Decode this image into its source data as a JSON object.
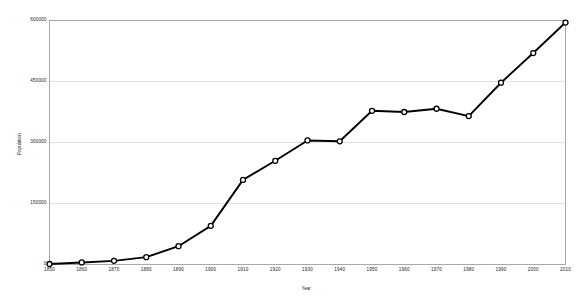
{
  "chart_data": {
    "type": "line",
    "title": "",
    "subtitle": "",
    "xlabel": "Year",
    "ylabel": "Population",
    "x": [
      1850,
      1860,
      1870,
      1880,
      1890,
      1900,
      1910,
      1920,
      1930,
      1940,
      1950,
      1960,
      1970,
      1980,
      1990,
      2000,
      2010
    ],
    "xtick_labels": [
      "1850",
      "1860",
      "1870",
      "1880",
      "1890",
      "1900",
      "1910",
      "1920",
      "1930",
      "1940",
      "1950",
      "1960",
      "1970",
      "1980",
      "1990",
      "2000",
      "2010"
    ],
    "values": [
      1200,
      5000,
      9000,
      18000,
      45000,
      95000,
      208000,
      255000,
      305000,
      303000,
      378000,
      375000,
      383000,
      365000,
      447000,
      520000,
      595000
    ],
    "ytick_labels": [
      "0",
      "150000",
      "300000",
      "450000",
      "600000"
    ],
    "ytick_values": [
      0,
      150000,
      300000,
      450000,
      600000
    ],
    "ylim": [
      0,
      600000
    ],
    "xlim": [
      1850,
      2010
    ],
    "grid": "horizontal",
    "legend": "none",
    "series": [
      {
        "name": "Population",
        "values": [
          1200,
          5000,
          9000,
          18000,
          45000,
          95000,
          208000,
          255000,
          305000,
          303000,
          378000,
          375000,
          383000,
          365000,
          447000,
          520000,
          595000
        ]
      }
    ],
    "style": {
      "line_color": "#000000",
      "marker_fill": "#ffffff",
      "marker_edge": "#000000",
      "grid_color": "#d9d9d9",
      "frame_color": "#a0a0a0",
      "background": "#ffffff"
    }
  }
}
